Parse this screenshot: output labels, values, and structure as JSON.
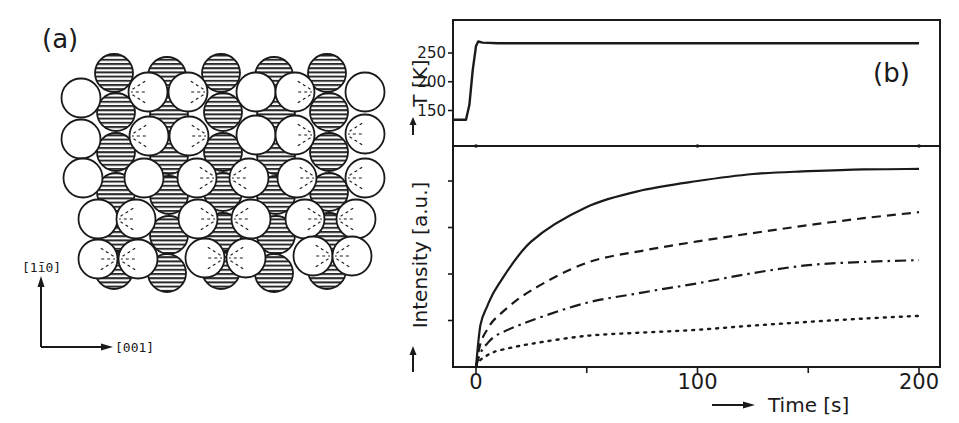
{
  "figure": {
    "panel_a_label": "(a)",
    "panel_b_label": "(b)",
    "direction_vertical": "[1ī0]",
    "direction_horizontal": "[001]",
    "hatched_circle_role": "substrate row atoms",
    "open_circle_role": "adsorbate atoms"
  },
  "chart_data": [
    {
      "type": "line",
      "panel": "(b) top",
      "title": "",
      "xlabel": "Time [s]",
      "ylabel": "T [K]",
      "xlim": [
        -10,
        210
      ],
      "ylim": [
        125,
        290
      ],
      "yticks": [
        150,
        200,
        250
      ],
      "ytick_labels": [
        "150",
        "200",
        "250"
      ],
      "grid": false,
      "series": [
        {
          "name": "Temperature",
          "style": "solid",
          "x": [
            -10,
            -4.5,
            -3,
            -1.5,
            0,
            1,
            3,
            10,
            50,
            100,
            150,
            200
          ],
          "y": [
            134,
            134,
            160,
            220,
            262,
            270,
            268,
            267,
            267,
            267,
            267,
            267
          ]
        }
      ]
    },
    {
      "type": "line",
      "panel": "(b) bottom",
      "title": "",
      "xlabel": "Time [s]",
      "ylabel": "Intensity [a.u.]",
      "xlim": [
        -10,
        210
      ],
      "ylim": [
        0,
        4.75
      ],
      "xticks": [
        0,
        50,
        100,
        150,
        200
      ],
      "xtick_labels": [
        "0",
        "",
        "100",
        "",
        "200"
      ],
      "yticks": [
        1,
        2,
        3,
        4
      ],
      "ytick_labels": [
        "",
        "",
        "",
        ""
      ],
      "grid": false,
      "legend": "none",
      "series": [
        {
          "name": "solid",
          "style": "solid",
          "x": [
            0,
            2,
            5,
            10,
            25,
            50,
            75,
            100,
            125,
            150,
            175,
            200
          ],
          "y": [
            0,
            0.9,
            1.3,
            1.76,
            2.7,
            3.44,
            3.8,
            4.0,
            4.15,
            4.21,
            4.25,
            4.26
          ]
        },
        {
          "name": "dashed",
          "style": "dashed",
          "x": [
            0,
            2,
            5,
            10,
            25,
            50,
            75,
            100,
            125,
            150,
            175,
            200
          ],
          "y": [
            0,
            0.5,
            0.8,
            1.1,
            1.65,
            2.24,
            2.5,
            2.7,
            2.88,
            3.05,
            3.2,
            3.33
          ]
        },
        {
          "name": "dash-dot",
          "style": "dash-dot",
          "x": [
            0,
            2,
            5,
            10,
            25,
            50,
            75,
            100,
            125,
            150,
            175,
            200
          ],
          "y": [
            0,
            0.3,
            0.5,
            0.7,
            1.0,
            1.38,
            1.6,
            1.8,
            2.02,
            2.19,
            2.26,
            2.3
          ]
        },
        {
          "name": "dotted",
          "style": "dotted",
          "x": [
            0,
            2,
            5,
            10,
            25,
            50,
            75,
            100,
            125,
            150,
            175,
            200
          ],
          "y": [
            0,
            0.15,
            0.25,
            0.35,
            0.5,
            0.67,
            0.74,
            0.8,
            0.89,
            0.97,
            1.04,
            1.1
          ]
        }
      ]
    }
  ]
}
